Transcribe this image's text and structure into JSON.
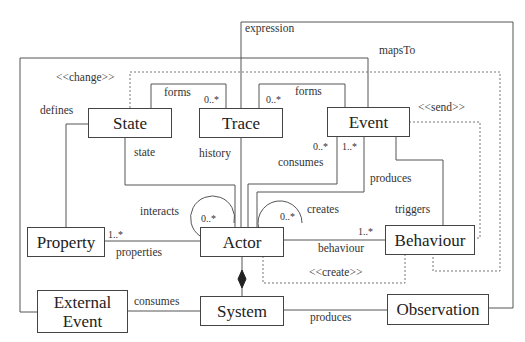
{
  "classes": {
    "state": "State",
    "trace": "Trace",
    "event": "Event",
    "property": "Property",
    "actor": "Actor",
    "behaviour": "Behaviour",
    "external_event": "External Event",
    "system": "System",
    "observation": "Observation"
  },
  "labels": {
    "expression": "expression",
    "maps_to": "mapsTo",
    "change": "<<change>>",
    "send": "<<send>>",
    "create": "<<create>>",
    "defines": "defines",
    "forms_state_trace": "forms",
    "forms_trace_event": "forms",
    "state": "state",
    "history": "history",
    "consumes_event": "consumes",
    "produces_event": "produces",
    "triggers": "triggers",
    "interacts": "interacts",
    "creates": "creates",
    "properties": "properties",
    "behaviour": "behaviour",
    "consumes_external": "consumes",
    "produces_observation": "produces"
  },
  "multiplicities": {
    "forms_state": "0..*",
    "forms_trace": "0..*",
    "consumes": "0..*",
    "produces": "1..*",
    "interacts": "0..*",
    "creates": "0..*",
    "properties": "1..*",
    "behaviour": "1..*"
  }
}
